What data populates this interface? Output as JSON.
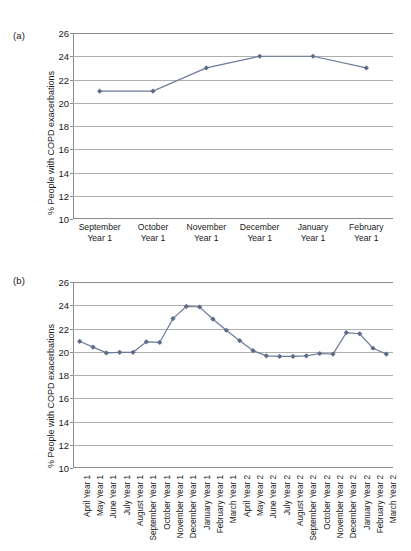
{
  "figure": {
    "panels": [
      {
        "tag": "(a)",
        "ylabel": "% People with COPD exacerbations"
      },
      {
        "tag": "(b)",
        "ylabel": "% People with COPD exacerbations"
      }
    ]
  },
  "style": {
    "line_color": "#6b7a99",
    "marker_color": "#5d6b88",
    "grid_color": "#aeaeae",
    "axis_color": "#8a8a8a",
    "text_color": "#1a1a1a"
  },
  "chart_data": [
    {
      "type": "line",
      "panel": "(a)",
      "title": "",
      "xlabel": "",
      "ylabel": "% People with COPD exacerbations",
      "ylim": [
        10,
        26
      ],
      "yticks": [
        10,
        12,
        14,
        16,
        18,
        20,
        22,
        24,
        26
      ],
      "grid": true,
      "legend": "none",
      "categories": [
        "September Year 1",
        "October Year 1",
        "November Year 1",
        "December Year 1",
        "January Year 1",
        "February Year 1"
      ],
      "category_lines": [
        [
          "September",
          "Year 1"
        ],
        [
          "October",
          "Year 1"
        ],
        [
          "November",
          "Year 1"
        ],
        [
          "December",
          "Year 1"
        ],
        [
          "January",
          "Year 1"
        ],
        [
          "February",
          "Year 1"
        ]
      ],
      "values": [
        21.0,
        21.0,
        23.0,
        24.0,
        24.0,
        23.0
      ]
    },
    {
      "type": "line",
      "panel": "(b)",
      "title": "",
      "xlabel": "",
      "ylabel": "% People with COPD exacerbations",
      "ylim": [
        10,
        26
      ],
      "yticks": [
        10,
        12,
        14,
        16,
        18,
        20,
        22,
        24,
        26
      ],
      "grid": true,
      "legend": "none",
      "categories": [
        "April Year 1",
        "May Year 1",
        "June Year 1",
        "July Year 1",
        "August Year 1",
        "September Year 1",
        "October Year 1",
        "November Year 1",
        "December Year 1",
        "January Year 1",
        "February Year 1",
        "March Year 1",
        "April Year 2",
        "May Year 2",
        "June Year 2",
        "July Year 2",
        "August Year 2",
        "September Year 2",
        "October Year 2",
        "November Year 2",
        "December Year 2",
        "January Year 2",
        "February Year 2",
        "March Year 2"
      ],
      "values": [
        20.9,
        20.4,
        19.9,
        19.95,
        19.95,
        20.85,
        20.8,
        22.85,
        23.9,
        23.85,
        22.8,
        21.85,
        20.95,
        20.1,
        19.65,
        19.6,
        19.6,
        19.65,
        19.85,
        19.8,
        21.65,
        21.55,
        20.3,
        19.8
      ]
    }
  ]
}
